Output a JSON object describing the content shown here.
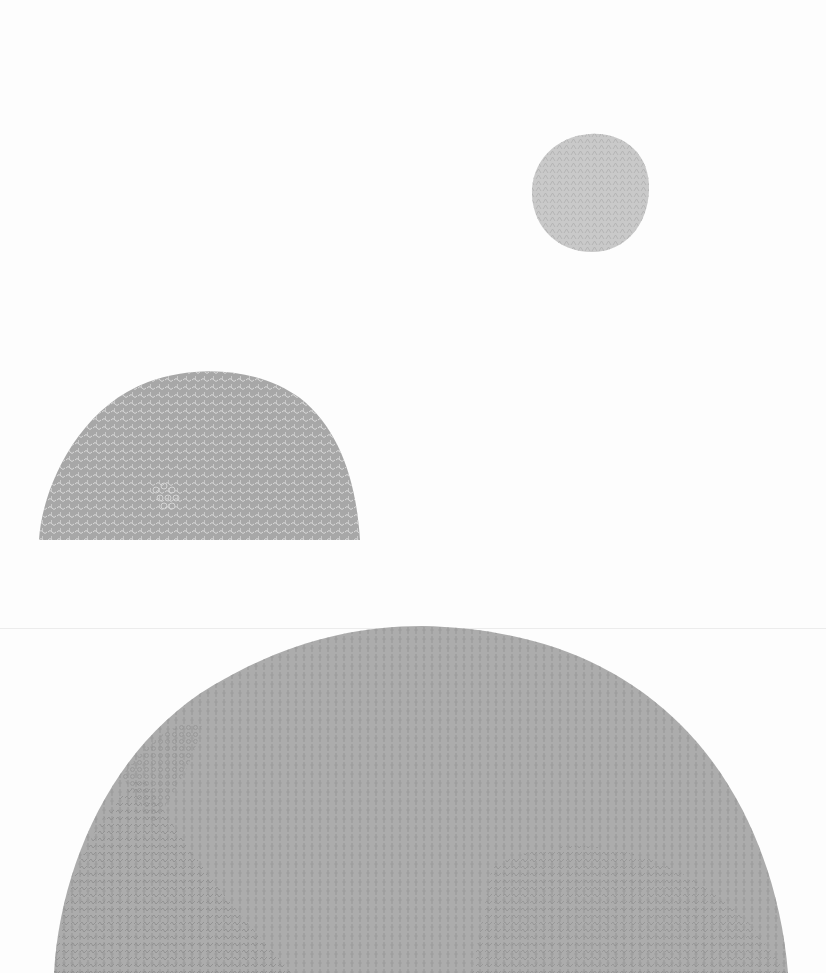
{
  "artwork": {
    "background_color": "#fdfdfd",
    "shapes": [
      {
        "name": "small-circle",
        "fill": "#c8c8c8",
        "mark_color": "#b4b4b4"
      },
      {
        "name": "half-dome",
        "fill": "#a6a6a6",
        "mark_color": "#d6d6d6"
      },
      {
        "name": "large-dome",
        "fill": "#ababab",
        "mark_color": "#8e8e8e"
      }
    ]
  }
}
